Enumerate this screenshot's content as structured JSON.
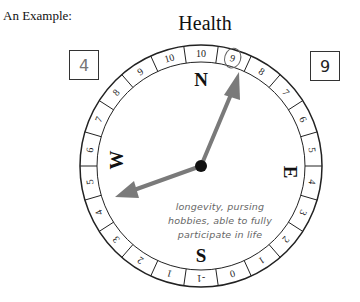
{
  "example_label": "An Example:",
  "title": "Health",
  "scores": {
    "left": "4",
    "right": "9"
  },
  "compass": {
    "directions": {
      "north": "N",
      "south": "S",
      "east": "E",
      "west": "W"
    },
    "scale_top": [
      "10",
      "9",
      "8",
      "7",
      "6",
      "5",
      "4",
      "3",
      "2",
      "1",
      "0"
    ],
    "circled_values": [
      "9",
      "4"
    ],
    "colors": {
      "arrow": "#7a7a7a",
      "ring": "#222222",
      "hub": "#111111"
    }
  },
  "note": {
    "lines": [
      "longevity, pursing",
      "hobbies, able to fully",
      "participate in life"
    ]
  }
}
